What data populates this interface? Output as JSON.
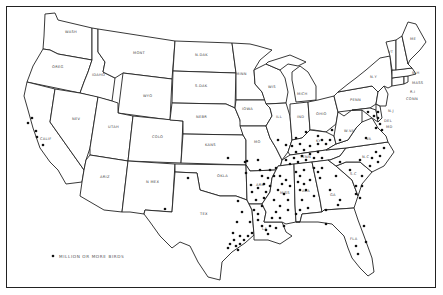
{
  "map": {
    "title": "",
    "legend": {
      "symbol": "dot",
      "label": "MILLION OR MORE BIRDS"
    },
    "state_labels": {
      "wash": "WASH",
      "oreg": "OREG",
      "calif": "CALIF",
      "nev": "NEV",
      "idaho": "IDAHO",
      "mont": "MONT",
      "wyo": "WYO",
      "utah": "UTAH",
      "ariz": "ARIZ",
      "colo": "COLO",
      "nmex": "N MEX",
      "ndak": "N.DAK",
      "sdak": "S.DAK",
      "nebr": "NEBR",
      "kans": "KANS",
      "okla": "OKLA",
      "tex": "TEX",
      "minn": "MINN",
      "iowa": "IOWA",
      "mo": "MO",
      "ark": "ARK",
      "la": "LA",
      "wis": "WIS",
      "ill": "ILL",
      "mich": "MICH",
      "ind": "IND",
      "ohio": "OHIO",
      "ky": "KY",
      "tenn": "TENN",
      "miss": "MISS",
      "ala": "ALA",
      "ga": "GA",
      "fla": "FLA",
      "sc": "S.C",
      "nc": "N.C",
      "va": "VA",
      "wva": "W.VA",
      "md": "MD",
      "del": "DEL",
      "nj": "N.J",
      "pa": "PENN",
      "ny": "N.Y",
      "conn": "CONN",
      "ri": "R.I",
      "mass": "MASS",
      "vt": "VT",
      "nh": "N.H",
      "me": "ME"
    }
  }
}
